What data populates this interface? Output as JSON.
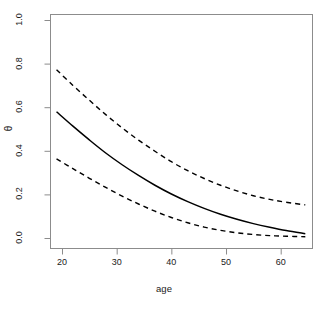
{
  "chart_data": {
    "type": "line",
    "title": "",
    "subtitle": "",
    "xlabel": "age",
    "ylabel": "θ",
    "xlim": [
      19,
      64.5
    ],
    "ylim": [
      0.0,
      1.0
    ],
    "grid": false,
    "legend": null,
    "x_ticks": [
      20,
      30,
      40,
      50,
      60
    ],
    "x_tick_labels": [
      "20",
      "30",
      "40",
      "50",
      "60"
    ],
    "y_ticks": [
      0.0,
      0.2,
      0.4,
      0.6,
      0.8,
      1.0
    ],
    "y_tick_labels": [
      "0.0",
      "0.2",
      "0.4",
      "0.6",
      "0.8",
      "1.0"
    ],
    "x": [
      19,
      22,
      25,
      28,
      31,
      34,
      37,
      40,
      43,
      46,
      49,
      52,
      55,
      58,
      61,
      64.5
    ],
    "series": [
      {
        "name": "upper confidence band",
        "style": "dashed",
        "color": "#000000",
        "values": [
          0.772,
          0.7,
          0.632,
          0.566,
          0.505,
          0.449,
          0.398,
          0.35,
          0.309,
          0.273,
          0.242,
          0.216,
          0.194,
          0.177,
          0.164,
          0.152
        ]
      },
      {
        "name": "estimate",
        "style": "solid",
        "color": "#000000",
        "values": [
          0.579,
          0.513,
          0.45,
          0.39,
          0.336,
          0.287,
          0.242,
          0.202,
          0.167,
          0.136,
          0.109,
          0.086,
          0.066,
          0.049,
          0.034,
          0.02
        ]
      },
      {
        "name": "lower confidence band",
        "style": "dashed",
        "color": "#000000",
        "values": [
          0.363,
          0.318,
          0.274,
          0.232,
          0.192,
          0.156,
          0.123,
          0.094,
          0.07,
          0.05,
          0.035,
          0.024,
          0.016,
          0.011,
          0.008,
          0.006
        ]
      }
    ],
    "axis_color": "#808080",
    "box": true
  }
}
